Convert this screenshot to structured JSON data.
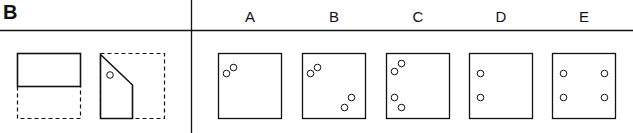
{
  "section_label": "B",
  "options": [
    {
      "label": "A",
      "holes": [
        [
          8,
          20
        ],
        [
          15,
          14
        ]
      ]
    },
    {
      "label": "B",
      "holes": [
        [
          8,
          20
        ],
        [
          15,
          14
        ],
        [
          42,
          48
        ],
        [
          49,
          42
        ]
      ]
    },
    {
      "label": "C",
      "holes": [
        [
          8,
          20
        ],
        [
          15,
          14
        ],
        [
          8,
          44
        ],
        [
          15,
          50
        ]
      ]
    },
    {
      "label": "D",
      "holes": [
        [
          10,
          20
        ],
        [
          10,
          45
        ]
      ]
    },
    {
      "label": "E",
      "holes": [
        [
          10,
          20
        ],
        [
          10,
          45
        ],
        [
          53,
          20
        ],
        [
          53,
          45
        ]
      ]
    }
  ]
}
